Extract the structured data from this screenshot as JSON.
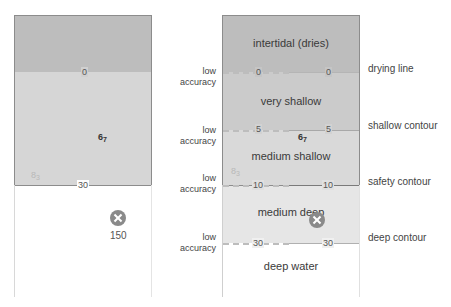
{
  "left_panel": {
    "colors": {
      "drying": "#bdbdbd",
      "shallow": "#d6d6d6",
      "deep": "#ffffff"
    },
    "contour_labels": {
      "zero": "0",
      "thirty": "30"
    },
    "soundings": [
      {
        "value": "6",
        "sub": "7",
        "faint": false
      },
      {
        "value": "8",
        "sub": "3",
        "faint": true
      }
    ],
    "wreck": {
      "icon": "wreck-icon",
      "depth_label": "150"
    }
  },
  "right_panel": {
    "bands": [
      {
        "label": "intertidal (dries)",
        "color": "#bdbdbd"
      },
      {
        "label": "very shallow",
        "color": "#cbcbcb"
      },
      {
        "label": "medium shallow",
        "color": "#d9d9d9"
      },
      {
        "label": "medium deep",
        "color": "#e6e6e6"
      },
      {
        "label": "deep water",
        "color": "#ffffff"
      }
    ],
    "depth_lines": [
      {
        "left": "0",
        "right": "0",
        "contour": "drying line",
        "accuracy": [
          "low",
          "accuracy"
        ]
      },
      {
        "left": "5",
        "right": "5",
        "contour": "shallow contour",
        "accuracy": [
          "low",
          "accuracy"
        ]
      },
      {
        "left": "10",
        "right": "10",
        "contour": "safety contour",
        "accuracy": [
          "low",
          "accuracy"
        ]
      },
      {
        "left": "30",
        "right": "30",
        "contour": "deep contour",
        "accuracy": [
          "low",
          "accuracy"
        ]
      }
    ],
    "soundings": [
      {
        "value": "6",
        "sub": "7",
        "faint": false
      },
      {
        "value": "8",
        "sub": "3",
        "faint": true
      }
    ],
    "wreck": {
      "icon": "wreck-icon"
    }
  }
}
